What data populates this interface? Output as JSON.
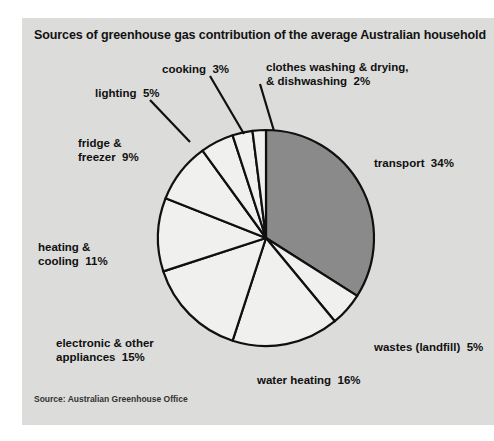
{
  "panel": {
    "title": "Sources of greenhouse gas contribution of the average Australian household",
    "source": "Source: Australian Greenhouse Office",
    "background_color": "#dcdcda",
    "page_background_color": "#ffffff"
  },
  "chart_data": {
    "type": "pie",
    "title": "Sources of greenhouse gas contribution of the average Australian household",
    "source": "Source: Australian Greenhouse Office",
    "unit": "%",
    "total": 100,
    "start_angle_deg": 0,
    "direction": "clockwise",
    "legend": "none",
    "categories": [
      "transport",
      "wastes (landfill)",
      "water heating",
      "electronic & other appliances",
      "heating & cooling",
      "fridge & freezer",
      "lighting",
      "cooking",
      "clothes washing & drying, & dishwashing"
    ],
    "values": [
      34,
      5,
      16,
      15,
      11,
      9,
      5,
      3,
      2
    ],
    "slices": [
      {
        "name": "transport",
        "value": 34,
        "label": "transport  34%",
        "label_lines": [
          "transport  34%"
        ],
        "fill": "#8a8a8a",
        "highlighted": true,
        "label_x": 352,
        "label_y": 138,
        "leader": false
      },
      {
        "name": "wastes (landfill)",
        "value": 5,
        "label": "wastes (landfill)  5%",
        "label_lines": [
          "wastes (landfill)  5%"
        ],
        "fill": "#f0f0ee",
        "highlighted": false,
        "label_x": 352,
        "label_y": 322,
        "leader": false
      },
      {
        "name": "water heating",
        "value": 16,
        "label": "water heating  16%",
        "label_lines": [
          "water heating  16%"
        ],
        "fill": "#f0f0ee",
        "highlighted": false,
        "label_x": 235,
        "label_y": 355,
        "leader": false
      },
      {
        "name": "electronic & other appliances",
        "value": 15,
        "label": "electronic & other appliances  15%",
        "label_lines": [
          "electronic & other",
          "appliances  15%"
        ],
        "fill": "#f0f0ee",
        "highlighted": false,
        "label_x": 34,
        "label_y": 318,
        "leader": false
      },
      {
        "name": "heating & cooling",
        "value": 11,
        "label": "heating & cooling  11%",
        "label_lines": [
          "heating &",
          "cooling  11%"
        ],
        "fill": "#f0f0ee",
        "highlighted": false,
        "label_x": 16,
        "label_y": 222,
        "leader": false
      },
      {
        "name": "fridge & freezer",
        "value": 9,
        "label": "fridge & freezer  9%",
        "label_lines": [
          "fridge &",
          "freezer  9%"
        ],
        "fill": "#f0f0ee",
        "highlighted": false,
        "label_x": 56,
        "label_y": 118,
        "leader": false
      },
      {
        "name": "lighting",
        "value": 5,
        "label": "lighting  5%",
        "label_lines": [
          "lighting  5%"
        ],
        "fill": "#f0f0ee",
        "highlighted": false,
        "label_x": 73,
        "label_y": 68,
        "leader": true
      },
      {
        "name": "cooking",
        "value": 3,
        "label": "cooking  3%",
        "label_lines": [
          "cooking  3%"
        ],
        "fill": "#f0f0ee",
        "highlighted": false,
        "label_x": 140,
        "label_y": 44,
        "leader": true
      },
      {
        "name": "clothes washing & drying, & dishwashing",
        "value": 2,
        "label": "clothes washing & drying, & dishwashing  2%",
        "label_lines": [
          "clothes washing & drying,",
          "& dishwashing  2%"
        ],
        "fill": "#f0f0ee",
        "highlighted": false,
        "label_x": 244,
        "label_y": 42,
        "leader": true
      }
    ],
    "geometry": {
      "center_x": 244,
      "center_y": 220,
      "radius": 108,
      "stroke_color": "#101010",
      "stroke_width": 2.2
    },
    "leaders": [
      {
        "name": "lighting-leader",
        "x1": 128,
        "y1": 82,
        "x2": 168,
        "y2": 124
      },
      {
        "name": "cooking-leader",
        "x1": 188,
        "y1": 58,
        "x2": 222,
        "y2": 116
      },
      {
        "name": "clothes-washing-leader",
        "x1": 238,
        "y1": 66,
        "x2": 252,
        "y2": 113
      }
    ]
  }
}
